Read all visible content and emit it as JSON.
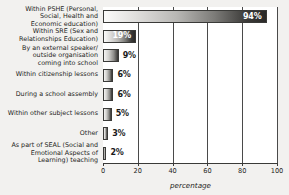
{
  "chart_data": {
    "type": "bar",
    "orientation": "horizontal",
    "title": "",
    "xlabel": "percentage",
    "ylabel": "",
    "xlim": [
      0,
      100
    ],
    "xticks": [
      0,
      20,
      40,
      60,
      80,
      100
    ],
    "xtick_labels": [
      "0",
      "20",
      "40",
      "60",
      "80",
      "100"
    ],
    "grid": true,
    "grid_axis": "x",
    "legend": false,
    "categories": [
      "Within PSHE (Personal,\nSocial, Health and\nEconomic education)",
      "Within SRE (Sex and\nRelationships Education)",
      "By an external speaker/\noutside organisation\ncoming into school",
      "Within citizenship lessons",
      "During a school assembly",
      "Within other subject lessons",
      "Other",
      "As part of SEAL (Social and\nEmotional Aspects of\nLearning) teaching"
    ],
    "values": [
      94,
      19,
      9,
      6,
      6,
      5,
      3,
      2
    ],
    "data_labels": [
      "94%",
      "19%",
      "9%",
      "6%",
      "6%",
      "5%",
      "3%",
      "2%"
    ],
    "label_placement": [
      "inside",
      "inside",
      "outside",
      "outside",
      "outside",
      "outside",
      "outside",
      "outside"
    ],
    "bar_fill": "gradient-light-to-dark",
    "colors": {
      "bar_gradient_start": "#fbfbfa",
      "bar_gradient_end": "#2b2a28",
      "bar_outline": "#3a3a38",
      "gridline": "#4a4a4a",
      "axis": "#3a3a38",
      "text": "#1d1d1b",
      "inside_label_text": "#ffffff",
      "plot_background": "#ffffff",
      "page_background": "#f2f1ef"
    }
  }
}
